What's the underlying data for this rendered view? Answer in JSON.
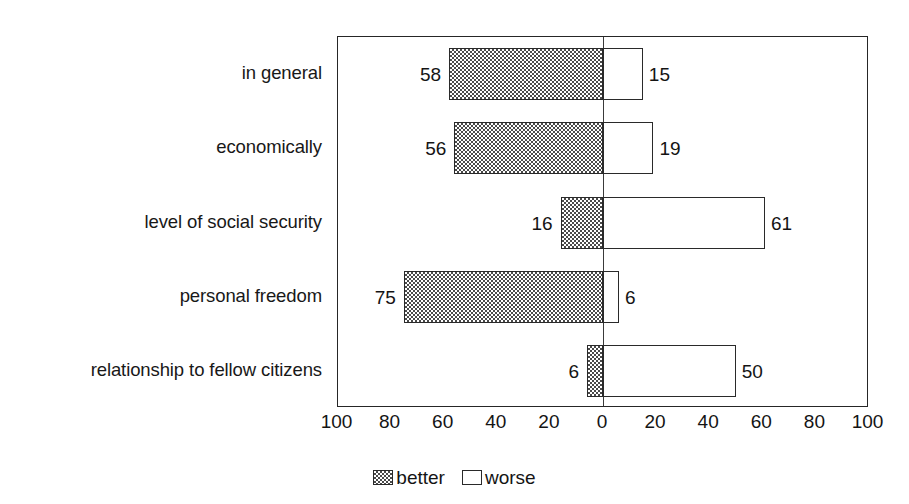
{
  "chart_data": {
    "type": "bar",
    "orientation": "horizontal",
    "style": "diverging-bidirectional",
    "title": "",
    "subtitle": "",
    "xlabel": "",
    "ylabel": "",
    "categories": [
      "in general",
      "economically",
      "level of social security",
      "personal freedom",
      "relationship to fellow citizens"
    ],
    "series": [
      {
        "name": "better",
        "direction": "left",
        "values": [
          58,
          56,
          16,
          75,
          6
        ]
      },
      {
        "name": "worse",
        "direction": "right",
        "values": [
          15,
          19,
          61,
          6,
          50
        ]
      }
    ],
    "xlim": [
      -100,
      100
    ],
    "xticks": [
      -100,
      -80,
      -60,
      -40,
      -20,
      0,
      20,
      40,
      60,
      80,
      100
    ],
    "xtick_labels": [
      "100",
      "80",
      "60",
      "40",
      "20",
      "0",
      "20",
      "40",
      "60",
      "80",
      "100"
    ],
    "grid": false,
    "legend": {
      "position": "bottom-center",
      "entries": [
        {
          "label": "better",
          "swatch": "hatched"
        },
        {
          "label": "worse",
          "swatch": "outline"
        }
      ]
    },
    "data_labels": {
      "better": [
        "58",
        "56",
        "16",
        "75",
        "6"
      ],
      "worse": [
        "15",
        "19",
        "61",
        "6",
        "50"
      ]
    },
    "colors": {
      "better_fill": "#4a4a4a",
      "worse_fill": "#ffffff",
      "outline": "#2a2a2a",
      "text": "#141414",
      "background": "#ffffff"
    }
  },
  "rows": [
    {
      "label": "in general",
      "better": 58,
      "worse": 15,
      "better_label": "58",
      "worse_label": "15"
    },
    {
      "label": "economically",
      "better": 56,
      "worse": 19,
      "better_label": "56",
      "worse_label": "19"
    },
    {
      "label": "level of social security",
      "better": 16,
      "worse": 61,
      "better_label": "16",
      "worse_label": "61"
    },
    {
      "label": "personal freedom",
      "better": 75,
      "worse": 6,
      "better_label": "75",
      "worse_label": "6"
    },
    {
      "label": "relationship to fellow citizens",
      "better": 6,
      "worse": 50,
      "better_label": "6",
      "worse_label": "50"
    }
  ],
  "axis": {
    "ticks": [
      "100",
      "80",
      "60",
      "40",
      "20",
      "0",
      "20",
      "40",
      "60",
      "80",
      "100"
    ]
  },
  "legend": {
    "better_label": "better",
    "worse_label": "worse"
  }
}
